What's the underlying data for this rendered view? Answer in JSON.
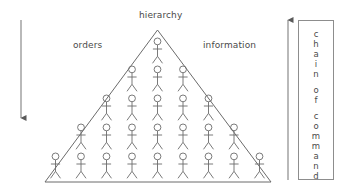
{
  "diagram": {
    "type": "hierarchy-pyramid",
    "title_label": "hierarchy",
    "left_label": "orders",
    "right_label": "information",
    "left_arrow": {
      "name": "downward-arrow",
      "direction": "down",
      "meaning": "orders flow down"
    },
    "right_arrow": {
      "name": "upward-arrow",
      "direction": "up",
      "meaning": "information flows up"
    },
    "pyramid": {
      "shape": "triangle",
      "rows": [
        {
          "level": 1,
          "figure_count": 1
        },
        {
          "level": 2,
          "figure_count": 3
        },
        {
          "level": 3,
          "figure_count": 5
        },
        {
          "level": 4,
          "figure_count": 7
        },
        {
          "level": 5,
          "figure_count": 9
        }
      ],
      "total_figures": 25,
      "figure_icon": "stick-figure-person-icon"
    },
    "side_panel": {
      "text": "chain of command",
      "orientation": "vertical-stacked-letters",
      "letters": [
        "c",
        "h",
        "a",
        "i",
        "n",
        "",
        "o",
        "f",
        "",
        "c",
        "o",
        "m",
        "m",
        "a",
        "n",
        "d"
      ]
    },
    "colors": {
      "background": "#ffffff",
      "stroke": "#6b6b6b",
      "text": "#4a4a4a",
      "box_border": "#8d8d8d",
      "arrow": "#7a7a7a"
    }
  }
}
